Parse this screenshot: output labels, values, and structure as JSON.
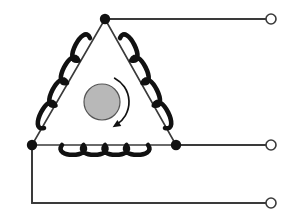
{
  "diagram": {
    "type": "electrical-schematic",
    "canvas": {
      "width": 290,
      "height": 213,
      "background": "#ffffff"
    },
    "colors": {
      "wire": "#3a3a3a",
      "coil": "#111111",
      "node_fill": "#111111",
      "terminal_stroke": "#3a3a3a",
      "terminal_fill": "#ffffff",
      "rotor_fill": "#b8b8b8",
      "rotor_stroke": "#555555",
      "arrow": "#111111"
    },
    "nodes": [
      {
        "name": "node-top",
        "label": "",
        "x": 105,
        "y": 19,
        "r": 5.2,
        "filled": true
      },
      {
        "name": "node-left",
        "label": "",
        "x": 32,
        "y": 145,
        "r": 5.2,
        "filled": true
      },
      {
        "name": "node-right",
        "label": "",
        "x": 176,
        "y": 145,
        "r": 5.2,
        "filled": true
      }
    ],
    "terminals": [
      {
        "name": "terminal-top",
        "label": "",
        "x": 271,
        "y": 19,
        "r": 5.0
      },
      {
        "name": "terminal-middle",
        "label": "",
        "x": 271,
        "y": 145,
        "r": 5.0
      },
      {
        "name": "terminal-bottom",
        "label": "",
        "x": 271,
        "y": 203,
        "r": 5.0
      }
    ],
    "lead_wires": [
      {
        "name": "lead-top",
        "from_x": 105,
        "from_y": 19,
        "to_x": 266,
        "to_y": 19
      },
      {
        "name": "lead-middle",
        "from_x": 176,
        "from_y": 145,
        "to_x": 266,
        "to_y": 145
      },
      {
        "name": "lead-bottom-vertical",
        "from_x": 32,
        "from_y": 145,
        "to_x": 32,
        "to_y": 203
      },
      {
        "name": "lead-bottom-horizontal",
        "from_x": 32,
        "from_y": 203,
        "to_x": 266,
        "to_y": 203
      }
    ],
    "coils": [
      {
        "name": "coil-left",
        "label": "",
        "start_x": 90,
        "start_y": 38,
        "end_x": 44,
        "end_y": 128,
        "loops": 4,
        "amplitude": 13,
        "side": "left"
      },
      {
        "name": "coil-right",
        "label": "",
        "start_x": 120,
        "start_y": 38,
        "end_x": 165,
        "end_y": 128,
        "loops": 4,
        "amplitude": 13,
        "side": "right"
      },
      {
        "name": "coil-bottom",
        "label": "",
        "start_x": 62,
        "start_y": 145,
        "end_x": 148,
        "end_y": 145,
        "loops": 4,
        "amplitude": 13,
        "side": "bottom"
      }
    ],
    "rotor": {
      "name": "rotor",
      "label": "",
      "cx": 102,
      "cy": 102,
      "r": 18
    },
    "rotation_arrow": {
      "name": "rotation-arrow",
      "label": "",
      "direction": "clockwise",
      "cx": 102,
      "cy": 102,
      "r": 27,
      "start_angle_deg": -62,
      "end_angle_deg": 58
    }
  }
}
